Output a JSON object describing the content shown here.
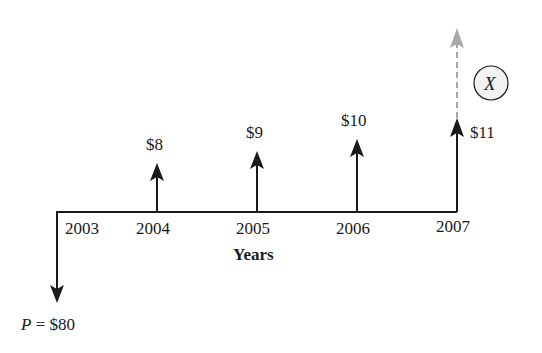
{
  "diagram": {
    "type": "cash-flow-timeline",
    "axis_label": "Years",
    "years": [
      "2003",
      "2004",
      "2005",
      "2006",
      "2007"
    ],
    "present_value": {
      "symbol": "P",
      "equals": "=",
      "amount": "$80",
      "direction": "down"
    },
    "cash_flows": [
      {
        "year": "2004",
        "amount": "$8",
        "direction": "up"
      },
      {
        "year": "2005",
        "amount": "$9",
        "direction": "up"
      },
      {
        "year": "2006",
        "amount": "$10",
        "direction": "up"
      },
      {
        "year": "2007",
        "amount": "$11",
        "direction": "up"
      }
    ],
    "unknown": {
      "label": "X",
      "year": "2007",
      "style": "dashed-gray-arrow"
    },
    "colors": {
      "line": "#1a1a1a",
      "dashed": "#a8a8a8",
      "circle_fill": "#f2f2f2"
    }
  }
}
